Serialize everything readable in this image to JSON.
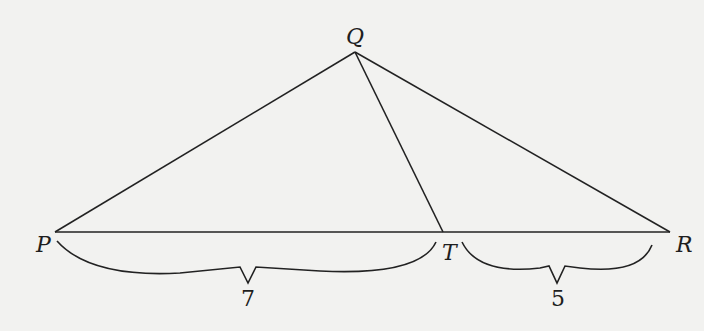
{
  "diagram": {
    "type": "triangle-with-cevian",
    "background": "#f2f2f0",
    "line_color": "#222222",
    "vertices": {
      "Q": {
        "label": "Q"
      },
      "P": {
        "label": "P"
      },
      "T": {
        "label": "T"
      },
      "R": {
        "label": "R"
      }
    },
    "segments": [
      {
        "from": "P",
        "to": "Q"
      },
      {
        "from": "Q",
        "to": "R"
      },
      {
        "from": "Q",
        "to": "T"
      },
      {
        "from": "P",
        "to": "R"
      }
    ],
    "measurements": {
      "PT": {
        "label": "7"
      },
      "TR": {
        "label": "5"
      }
    }
  }
}
